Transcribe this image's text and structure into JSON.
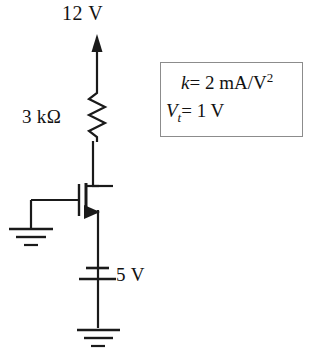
{
  "diagram": {
    "labels": {
      "supply_voltage": "12 V",
      "resistor_value": "3 kΩ",
      "battery_voltage": "5 V"
    },
    "parameter_box": {
      "k_symbol": "k",
      "k_equals": "= 2 mA/V",
      "k_exponent": "2",
      "vt_symbol": "V",
      "vt_subscript": "t",
      "vt_equals": "= 1 V"
    },
    "components": [
      {
        "name": "supply-arrow",
        "type": "arrow",
        "value": "12 V"
      },
      {
        "name": "drain-resistor",
        "type": "resistor",
        "value": "3 kΩ"
      },
      {
        "name": "nmos-transistor",
        "type": "n-channel-mosfet"
      },
      {
        "name": "gate-ground",
        "type": "ground"
      },
      {
        "name": "source-battery",
        "type": "battery",
        "value": "5 V"
      },
      {
        "name": "bottom-ground",
        "type": "ground"
      }
    ],
    "colors": {
      "wire": "#1a1a1a",
      "box_border": "#8c8c8c",
      "text": "#121212",
      "background": "#ffffff"
    }
  }
}
